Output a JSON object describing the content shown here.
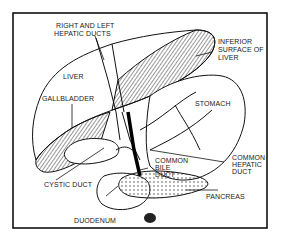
{
  "diagram": {
    "frame": {
      "x": 13,
      "y": 13,
      "width": 254,
      "height": 215,
      "color": "#111111"
    },
    "hatch_color": "#333333",
    "labels": {
      "hepatic_ducts_line1": "RIGHT AND LEFT",
      "hepatic_ducts_line2": "HEPATIC DUCTS",
      "inferior_line1": "INFERIOR",
      "inferior_line2": "SURFACE OF",
      "inferior_line3": "LIVER",
      "liver": "LIVER",
      "gallbladder": "GALLBLADDER",
      "stomach": "STOMACH",
      "common_bile_line1": "COMMON",
      "common_bile_line2": "BILE",
      "common_bile_line3": "DUCT",
      "common_hepatic_line1": "COMMON",
      "common_hepatic_line2": "HEPATIC",
      "common_hepatic_line3": "DUCT",
      "cystic_duct": "CYSTIC DUCT",
      "pancreas": "PANCREAS",
      "duodenum": "DUODENUM"
    }
  }
}
